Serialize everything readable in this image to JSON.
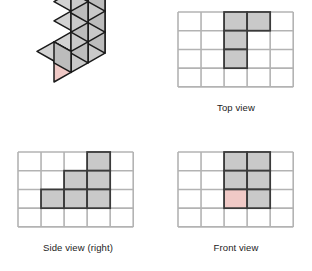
{
  "figure": {
    "background": "#ffffff"
  },
  "colors": {
    "cube_fill": "#c9c9c9",
    "cube_fill_top": "#d2d2d2",
    "cube_fill_side": "#bcbcbc",
    "cube_outline": "#1a1a1a",
    "grid_line": "#b3b3b3",
    "cell_fill": "#c9c9c9",
    "cell_fill_highlight": "#f0c9c6",
    "cell_outline": "#3a3a3a",
    "caption_text": "#232323"
  },
  "panels": {
    "isometric": {
      "name": "isometric-solid",
      "caption": "",
      "cube_count": 8,
      "highlighted_cube": "front-left-bottom",
      "cubes": [
        {
          "col": 0,
          "row": 0,
          "level": 0,
          "highlight": true
        },
        {
          "col": 1,
          "row": 0,
          "level": 0,
          "highlight": false
        },
        {
          "col": 1,
          "row": 0,
          "level": 1,
          "highlight": false
        },
        {
          "col": 2,
          "row": 0,
          "level": 0,
          "highlight": false
        },
        {
          "col": 2,
          "row": 0,
          "level": 1,
          "highlight": false
        },
        {
          "col": 2,
          "row": 0,
          "level": 2,
          "highlight": false
        },
        {
          "col": 2,
          "row": 1,
          "level": 2,
          "highlight": false
        },
        {
          "col": 2,
          "row": 1,
          "level": 1,
          "highlight": false
        }
      ]
    },
    "top": {
      "name": "top-view",
      "caption": "Top view",
      "grid": {
        "cols": 5,
        "rows": 4
      },
      "cells": [
        {
          "col": 2,
          "row": 0,
          "fill": "normal"
        },
        {
          "col": 3,
          "row": 0,
          "fill": "normal"
        },
        {
          "col": 2,
          "row": 1,
          "fill": "normal"
        },
        {
          "col": 2,
          "row": 2,
          "fill": "normal"
        }
      ]
    },
    "side": {
      "name": "side-view-right",
      "caption": "Side view (right)",
      "grid": {
        "cols": 5,
        "rows": 4
      },
      "cells": [
        {
          "col": 3,
          "row": 0,
          "fill": "normal"
        },
        {
          "col": 2,
          "row": 1,
          "fill": "normal"
        },
        {
          "col": 3,
          "row": 1,
          "fill": "normal"
        },
        {
          "col": 1,
          "row": 2,
          "fill": "normal"
        },
        {
          "col": 2,
          "row": 2,
          "fill": "normal"
        },
        {
          "col": 3,
          "row": 2,
          "fill": "normal"
        }
      ]
    },
    "front": {
      "name": "front-view",
      "caption": "Front view",
      "grid": {
        "cols": 5,
        "rows": 4
      },
      "cells": [
        {
          "col": 2,
          "row": 0,
          "fill": "normal"
        },
        {
          "col": 3,
          "row": 0,
          "fill": "normal"
        },
        {
          "col": 2,
          "row": 1,
          "fill": "normal"
        },
        {
          "col": 3,
          "row": 1,
          "fill": "normal"
        },
        {
          "col": 2,
          "row": 2,
          "fill": "highlight"
        },
        {
          "col": 3,
          "row": 2,
          "fill": "normal"
        }
      ]
    }
  }
}
